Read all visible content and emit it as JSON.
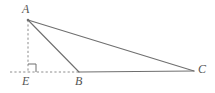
{
  "figure": {
    "type": "geometry-diagram",
    "canvas": {
      "width": 215,
      "height": 93,
      "background": "#ffffff"
    },
    "colors": {
      "solid_line": "#6f6f6f",
      "dashed_line": "#8c8c8c",
      "right_angle_marker": "#6f6f6f",
      "label_text": "#555555"
    },
    "points": {
      "A": {
        "x": 28,
        "y": 20,
        "label": "A"
      },
      "B": {
        "x": 79,
        "y": 72,
        "label": "B"
      },
      "C": {
        "x": 194,
        "y": 71,
        "label": "C"
      },
      "E": {
        "x": 28,
        "y": 72,
        "label": "E"
      }
    },
    "labels": [
      {
        "name": "A",
        "text": "A",
        "left": 22,
        "top": 3
      },
      {
        "name": "E",
        "text": "E",
        "left": 22,
        "top": 75
      },
      {
        "name": "B",
        "text": "B",
        "left": 75,
        "top": 75
      },
      {
        "name": "C",
        "text": "C",
        "left": 198,
        "top": 63
      }
    ],
    "segments": [
      {
        "name": "segment-AC",
        "from": "A",
        "to": "C",
        "style": "solid"
      },
      {
        "name": "segment-AB",
        "from": "A",
        "to": "B",
        "style": "solid"
      },
      {
        "name": "segment-BC",
        "from": "B",
        "to": "C",
        "style": "solid"
      },
      {
        "name": "segment-AE",
        "from": "A",
        "to": "E",
        "style": "dashed"
      },
      {
        "name": "segment-EB",
        "from": "E",
        "to": "B",
        "style": "dashed"
      },
      {
        "name": "baseline-extension-left",
        "from_x": 10,
        "to_x": 28,
        "y": 72,
        "style": "dashed"
      }
    ],
    "right_angle": {
      "at": "E",
      "size": 8,
      "opens": "up-right"
    }
  }
}
